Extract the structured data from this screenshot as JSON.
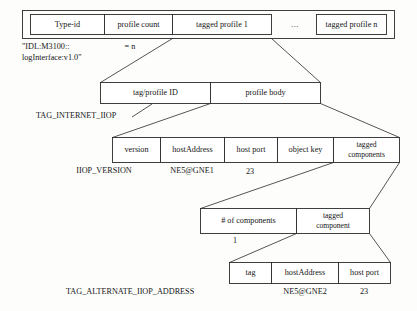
{
  "diagram": {
    "colors": {
      "stroke": "#2a2a2a",
      "fill": "#ffffff",
      "text": "#151515",
      "background": "#fdfdfc"
    },
    "rows": [
      {
        "id": "ior-row",
        "name": "ior-structure-row",
        "cells": [
          {
            "label": "Type-id"
          },
          {
            "label": "profile count"
          },
          {
            "label": "tagged profile 1"
          },
          {
            "label": "..."
          },
          {
            "label": "tagged profile n"
          }
        ]
      },
      {
        "id": "tagged-profile-row",
        "name": "tagged-profile-row",
        "cells": [
          {
            "label": "tag/profile ID"
          },
          {
            "label": "profile body"
          }
        ]
      },
      {
        "id": "profile-body-row",
        "name": "profile-body-row",
        "cells": [
          {
            "label": "version"
          },
          {
            "label": "hostAddress"
          },
          {
            "label": "host port"
          },
          {
            "label": "object key"
          },
          {
            "label": "tagged",
            "label2": "components"
          }
        ]
      },
      {
        "id": "components-row",
        "name": "tagged-components-row",
        "cells": [
          {
            "label": "# of components"
          },
          {
            "label": "tagged",
            "label2": "component"
          }
        ]
      },
      {
        "id": "alternate-address-row",
        "name": "alternate-address-row",
        "cells": [
          {
            "label": "tag"
          },
          {
            "label": "hostAddress"
          },
          {
            "label": "host port"
          }
        ]
      }
    ],
    "annotations": {
      "type_id_value_line1": "\"IDL:M3100::",
      "type_id_value_line2": "logInterface:v1.0\"",
      "profile_count_value": "= n",
      "tag_profile_id_value": "TAG_INTERNET_IIOP",
      "version_value": "IIOP_VERSION",
      "host_address_value": "NE5@GNE1",
      "host_port_value": "23",
      "component_count_value": "1",
      "alternate_tag_value": "TAG_ALTERNATE_IIOP_ADDRESS",
      "alternate_host_address_value": "NE5@GNE2",
      "alternate_host_port_value": "23"
    }
  }
}
